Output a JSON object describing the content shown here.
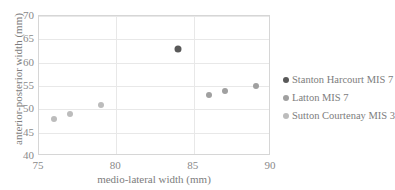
{
  "chart_data": {
    "type": "scatter",
    "title": "",
    "xlabel": "medio-lateral width (mm)",
    "ylabel": "anterior-posterior width (mm)",
    "xlim": [
      75,
      90
    ],
    "ylim": [
      40,
      70
    ],
    "xticks": [
      75,
      80,
      85,
      90
    ],
    "yticks": [
      40,
      45,
      50,
      55,
      60,
      65,
      70
    ],
    "grid": true,
    "legend_position": "right",
    "series": [
      {
        "name": "Stanton Harcourt MIS 7",
        "color": "#595959",
        "points": [
          {
            "x": 84,
            "y": 63
          }
        ]
      },
      {
        "name": "Latton MIS 7",
        "color": "#a0a0a0",
        "points": [
          {
            "x": 86,
            "y": 53
          },
          {
            "x": 87,
            "y": 54
          },
          {
            "x": 89,
            "y": 55
          }
        ]
      },
      {
        "name": "Sutton Courtenay MIS 3",
        "color": "#bcbcbc",
        "points": [
          {
            "x": 76,
            "y": 48
          },
          {
            "x": 77,
            "y": 49
          },
          {
            "x": 79,
            "y": 51
          }
        ]
      }
    ]
  }
}
